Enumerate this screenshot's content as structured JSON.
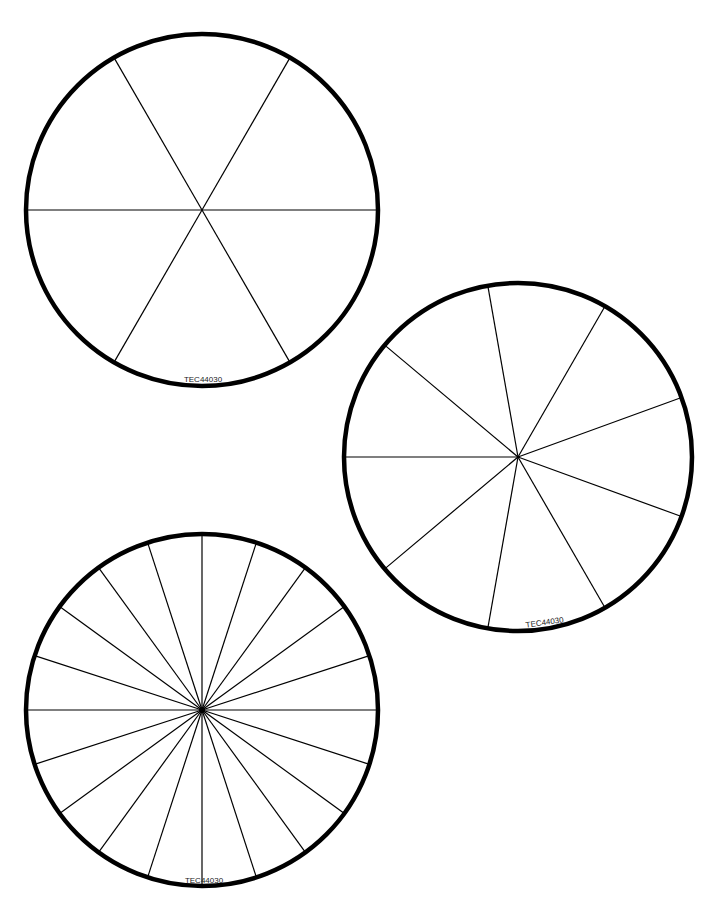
{
  "page": {
    "background": "#ffffff",
    "stroke": "#000000"
  },
  "wheels": [
    {
      "name": "wheel-6-segments",
      "cx": 202,
      "cy": 210,
      "r": 176,
      "segments": 6,
      "start_angle": 0,
      "label": "TEC44030",
      "label_x": 203,
      "label_y": 382,
      "label_rotate": 0
    },
    {
      "name": "wheel-9-segments",
      "cx": 518,
      "cy": 457,
      "r": 174,
      "segments": 9,
      "start_angle": 180,
      "label": "TEC44030",
      "label_x": 545,
      "label_y": 625,
      "label_rotate": -8
    },
    {
      "name": "wheel-20-segments",
      "cx": 202,
      "cy": 710,
      "r": 176,
      "segments": 20,
      "start_angle": 0,
      "label": "TEC44030",
      "label_x": 204,
      "label_y": 883,
      "label_rotate": 0
    }
  ]
}
